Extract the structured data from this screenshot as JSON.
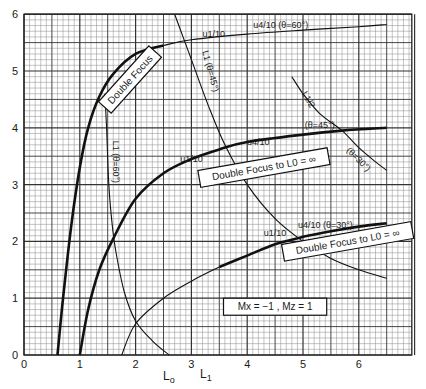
{
  "chart_data": {
    "type": "line",
    "title": "",
    "xlabel": "L0   L1",
    "ylabel": "",
    "xlim": [
      0,
      6.95
    ],
    "ylim": [
      0,
      6
    ],
    "grid": true,
    "x_ticks": [
      "0",
      "1",
      "2",
      "3",
      "4",
      "5",
      "6"
    ],
    "y_ticks": [
      "0",
      "1",
      "2",
      "3",
      "4",
      "5",
      "6"
    ],
    "series": [
      {
        "name": "u1/10, u4/10 (θ=60°)",
        "style": "thick-then-thin",
        "points": [
          [
            0.6,
            0
          ],
          [
            0.7,
            1.0
          ],
          [
            0.85,
            2.3
          ],
          [
            1.0,
            3.3
          ],
          [
            1.15,
            4.0
          ],
          [
            1.35,
            4.55
          ],
          [
            1.6,
            4.95
          ],
          [
            2.0,
            5.3
          ],
          [
            2.5,
            5.45
          ],
          [
            3.0,
            5.55
          ],
          [
            4.0,
            5.65
          ],
          [
            5.0,
            5.72
          ],
          [
            6.0,
            5.78
          ],
          [
            6.5,
            5.82
          ]
        ]
      },
      {
        "name": "L1 (θ=60°)",
        "style": "thin",
        "points": [
          [
            1.45,
            4.6
          ],
          [
            1.48,
            4.0
          ],
          [
            1.52,
            3.0
          ],
          [
            1.58,
            2.3
          ],
          [
            1.65,
            1.8
          ],
          [
            1.8,
            1.1
          ],
          [
            2.0,
            0.6
          ],
          [
            2.3,
            0.25
          ],
          [
            2.6,
            0
          ]
        ]
      },
      {
        "name": "u1/10, u4/10 (θ=45°)",
        "style": "thick",
        "points": [
          [
            1.0,
            0
          ],
          [
            1.15,
            0.8
          ],
          [
            1.35,
            1.5
          ],
          [
            1.6,
            2.05
          ],
          [
            2.0,
            2.75
          ],
          [
            2.5,
            3.2
          ],
          [
            3.0,
            3.45
          ],
          [
            3.5,
            3.62
          ],
          [
            4.0,
            3.75
          ],
          [
            5.0,
            3.88
          ],
          [
            5.7,
            3.95
          ],
          [
            6.5,
            4.0
          ]
        ]
      },
      {
        "name": "L1 (θ=45°)",
        "style": "thin",
        "points": [
          [
            2.7,
            6.0
          ],
          [
            2.85,
            5.6
          ],
          [
            3.0,
            5.2
          ],
          [
            3.3,
            4.4
          ],
          [
            3.6,
            3.7
          ],
          [
            4.0,
            3.0
          ],
          [
            4.5,
            2.4
          ],
          [
            5.0,
            2.0
          ],
          [
            5.5,
            1.7
          ],
          [
            6.0,
            1.5
          ],
          [
            6.5,
            1.35
          ]
        ]
      },
      {
        "name": "u1/10, u4/10 (θ=30°)",
        "style": "thin-then-thick",
        "points": [
          [
            1.75,
            0
          ],
          [
            2.0,
            0.55
          ],
          [
            2.5,
            1.0
          ],
          [
            3.0,
            1.3
          ],
          [
            3.5,
            1.55
          ],
          [
            4.0,
            1.75
          ],
          [
            4.5,
            1.95
          ],
          [
            5.0,
            2.08
          ],
          [
            5.5,
            2.18
          ],
          [
            6.0,
            2.26
          ],
          [
            6.5,
            2.32
          ]
        ]
      },
      {
        "name": "L1/2 (θ=30°)",
        "style": "thin",
        "points": [
          [
            4.8,
            4.9
          ],
          [
            5.0,
            4.6
          ],
          [
            5.3,
            4.25
          ],
          [
            5.7,
            3.95
          ],
          [
            6.0,
            3.65
          ],
          [
            6.3,
            3.4
          ],
          [
            6.5,
            3.25
          ]
        ]
      }
    ],
    "annotations": [
      {
        "text": "Double Focus",
        "boxed": true,
        "x": 1.9,
        "y": 4.85,
        "rotate": -48
      },
      {
        "text": "Double Focus to L0 = ∞",
        "boxed": true,
        "x": 4.3,
        "y": 3.3,
        "rotate": -10
      },
      {
        "text": "Double Focus to L0 = ∞",
        "boxed": true,
        "x": 5.8,
        "y": 2.0,
        "rotate": -10
      },
      {
        "text": "Mx = −1 ,  Mz = 1",
        "boxed": true,
        "x": 4.5,
        "y": 0.85,
        "rotate": 0
      },
      {
        "text": "u1/10",
        "x": 3.4,
        "y": 5.65
      },
      {
        "text": "u4/10 (θ=60°)",
        "x": 4.6,
        "y": 5.82
      },
      {
        "text": "u1/10",
        "x": 3.0,
        "y": 3.45
      },
      {
        "text": "u4/10",
        "x": 4.2,
        "y": 3.75
      },
      {
        "text": "(θ=45°)",
        "x": 5.3,
        "y": 4.05
      },
      {
        "text": "u1/10",
        "x": 4.5,
        "y": 2.15
      },
      {
        "text": "u4/10 (θ=30°)",
        "x": 5.4,
        "y": 2.3
      },
      {
        "text": "L1 (θ=60°)",
        "x": 1.65,
        "y": 3.4,
        "rotate": 90
      },
      {
        "text": "L1 (θ=45°)",
        "x": 3.35,
        "y": 5.0,
        "rotate": 75
      },
      {
        "text": "L1/2",
        "x": 5.1,
        "y": 4.5,
        "rotate": 60
      },
      {
        "text": "(θ=30°)",
        "x": 6.0,
        "y": 3.45,
        "rotate": 45
      }
    ]
  },
  "axis": {
    "x_label_main": "L",
    "x_label_main_sub": "o",
    "x_label_secondary": "L",
    "x_label_secondary_sub": "1"
  }
}
